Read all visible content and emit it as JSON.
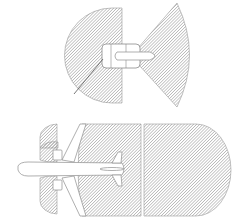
{
  "diagram": {
    "colors": {
      "background": "#ffffff",
      "hatch": "#8a8a8a",
      "outline": "#9a9a9a",
      "aircraft_fill": "#ffffff",
      "aircraft_stroke": "#8c8c8c",
      "pointer_line": "#555555"
    },
    "top_view": {
      "intake_zone": "half-disk hatched area in front of engine",
      "exhaust_zone": "fan-shaped hatched area behind engine",
      "engine": "engine nacelle outline at center"
    },
    "bottom_view": {
      "intake_zones": [
        "upper engine intake half-disk",
        "lower engine intake half-disk"
      ],
      "exhaust_zone_near": "rectangular hatched area behind aircraft",
      "exhaust_zone_far": "rounded-end hatched area further behind",
      "aircraft": "top-down aircraft silhouette facing left"
    }
  }
}
